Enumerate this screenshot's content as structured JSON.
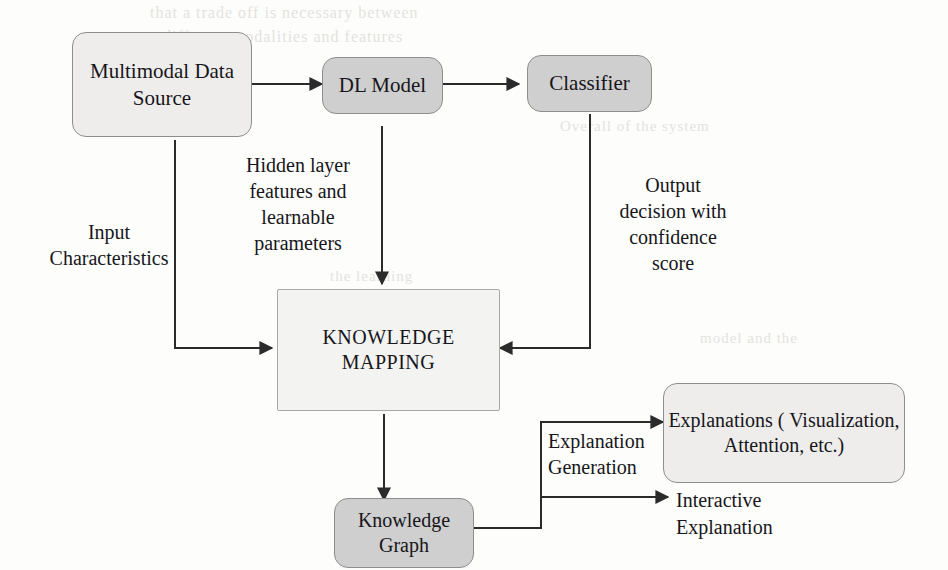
{
  "diagram": {
    "type": "flowchart",
    "colors": {
      "box_light_fill": "#eeedec",
      "box_mid_fill": "#cfcfcf",
      "box_pale_fill": "#f3f3f2",
      "border": "#8e8e8e",
      "arrow": "#2b2b2b",
      "text": "#17161a",
      "ghost_text": "#cfcdc8",
      "background": "#fdfdfc"
    },
    "nodes": [
      {
        "id": "multimodal-data-source",
        "label": "Multimodal\nData Source",
        "shape": "rounded-rect",
        "fill": "light"
      },
      {
        "id": "dl-model",
        "label": "DL Model",
        "shape": "rounded-rect",
        "fill": "mid"
      },
      {
        "id": "classifier",
        "label": "Classifier",
        "shape": "rounded-rect",
        "fill": "mid"
      },
      {
        "id": "knowledge-mapping",
        "label": "KNOWLEDGE\nMAPPING",
        "shape": "rect",
        "fill": "pale"
      },
      {
        "id": "knowledge-graph",
        "label": "Knowledge\nGraph",
        "shape": "rounded-rect",
        "fill": "mid"
      },
      {
        "id": "explanations",
        "label": "Explanations\n( Visualization,\nAttention, etc.)",
        "shape": "rounded-rect",
        "fill": "light"
      },
      {
        "id": "interactive-explanation",
        "label": "Interactive\nExplanation",
        "shape": "plain-text",
        "fill": "none"
      }
    ],
    "edge_labels": [
      {
        "id": "input-characteristics",
        "text": "Input\nCharacteristics",
        "from": "multimodal-data-source",
        "to": "knowledge-mapping"
      },
      {
        "id": "hidden-layer-features",
        "text": "Hidden layer\nfeatures and\nlearnable\nparameters",
        "from": "dl-model",
        "to": "knowledge-mapping"
      },
      {
        "id": "output-decision",
        "text": "Output\ndecision with\nconfidence\nscore",
        "from": "classifier",
        "to": "knowledge-mapping"
      },
      {
        "id": "explanation-generation",
        "text": "Explanation\nGeneration",
        "from": "knowledge-graph",
        "to": "explanations"
      }
    ],
    "edges": [
      {
        "id": "edge-source-to-model",
        "from": "multimodal-data-source",
        "to": "dl-model",
        "style": "straight-arrow"
      },
      {
        "id": "edge-model-to-classifier",
        "from": "dl-model",
        "to": "classifier",
        "style": "straight-arrow"
      },
      {
        "id": "edge-source-to-mapping",
        "from": "multimodal-data-source",
        "to": "knowledge-mapping",
        "style": "elbow-arrow"
      },
      {
        "id": "edge-model-to-mapping",
        "from": "dl-model",
        "to": "knowledge-mapping",
        "style": "straight-arrow"
      },
      {
        "id": "edge-classifier-to-mapping",
        "from": "classifier",
        "to": "knowledge-mapping",
        "style": "elbow-arrow"
      },
      {
        "id": "edge-mapping-to-graph",
        "from": "knowledge-mapping",
        "to": "knowledge-graph",
        "style": "straight-arrow"
      },
      {
        "id": "edge-graph-to-explanations",
        "from": "knowledge-graph",
        "to": "explanations",
        "style": "elbow-arrow"
      },
      {
        "id": "edge-graph-to-interactive",
        "from": "knowledge-graph",
        "to": "interactive-explanation",
        "style": "elbow-arrow"
      }
    ],
    "ghost_text": [
      {
        "id": "ghost-line-1",
        "text": "that  a  trade  off  is  necessary  between"
      },
      {
        "id": "ghost-line-2",
        "text": "different  modalities  and  features"
      },
      {
        "id": "ghost-line-3",
        "text": "Overall of the system"
      },
      {
        "id": "ghost-line-4",
        "text": "the  learning"
      },
      {
        "id": "ghost-line-5",
        "text": "model  and  the"
      }
    ]
  }
}
